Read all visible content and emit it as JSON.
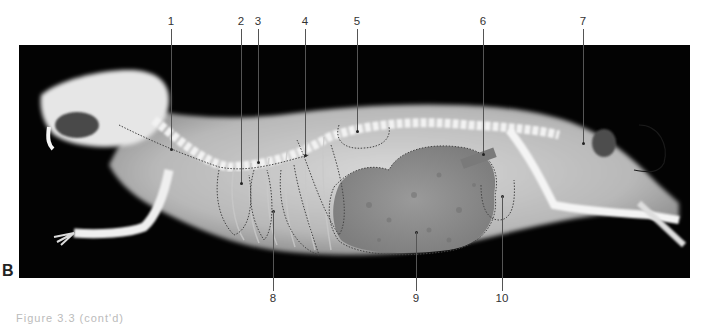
{
  "figure": {
    "panel_label": "B",
    "background_color": "#030303",
    "caption_partial": "Figure 3.3 (cont'd)"
  },
  "labels": [
    {
      "number": "1",
      "x": 171,
      "dot_y": 149
    },
    {
      "number": "2",
      "x": 241,
      "dot_y": 183
    },
    {
      "number": "3",
      "x": 258,
      "dot_y": 162
    },
    {
      "number": "4",
      "x": 305,
      "dot_y": 155
    },
    {
      "number": "5",
      "x": 357,
      "dot_y": 131
    },
    {
      "number": "6",
      "x": 483,
      "dot_y": 154
    },
    {
      "number": "7",
      "x": 583,
      "dot_y": 143
    },
    {
      "number": "8",
      "x": 273,
      "dot_y": 211,
      "bottom": true
    },
    {
      "number": "9",
      "x": 416,
      "dot_y": 232,
      "bottom": true
    },
    {
      "number": "10",
      "x": 502,
      "dot_y": 196,
      "bottom": true
    }
  ]
}
